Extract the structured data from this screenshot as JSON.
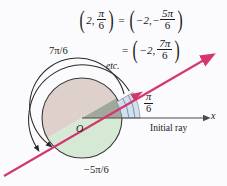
{
  "figure": {
    "background_color": "#fbfbfd",
    "ray_color": "#d4366f",
    "equations": {
      "line1": {
        "left_pair": {
          "r": "2",
          "theta_num": "π",
          "theta_den": "6"
        },
        "equals": "=",
        "right_pair": {
          "r": "−2",
          "theta_sign": "−",
          "theta_num": "5π",
          "theta_den": "6"
        }
      },
      "line2": {
        "equals": "=",
        "right_pair": {
          "r": "−2",
          "theta_num": "7π",
          "theta_den": "6"
        }
      },
      "etc": "etc."
    },
    "labels": {
      "upper_angle": "7π/6",
      "lower_angle": "−5π/6",
      "wedge_angle_num": "π",
      "wedge_angle_den": "6",
      "origin": "O",
      "axis": "x",
      "initial_ray": "Initial ray"
    },
    "colors": {
      "upper_disk": "#ded1cc",
      "lower_disk": "#d6e9d5",
      "wedge_blue": "#cfe0ef",
      "wedge_gray": "#8e8d87",
      "outline": "#2a2a2a",
      "axis": "#4a4a4a",
      "ray": "#d4366f"
    },
    "geometry": {
      "center_x": 82,
      "center_y": 118,
      "radius": 40,
      "ray_angle_deg": 30
    }
  }
}
